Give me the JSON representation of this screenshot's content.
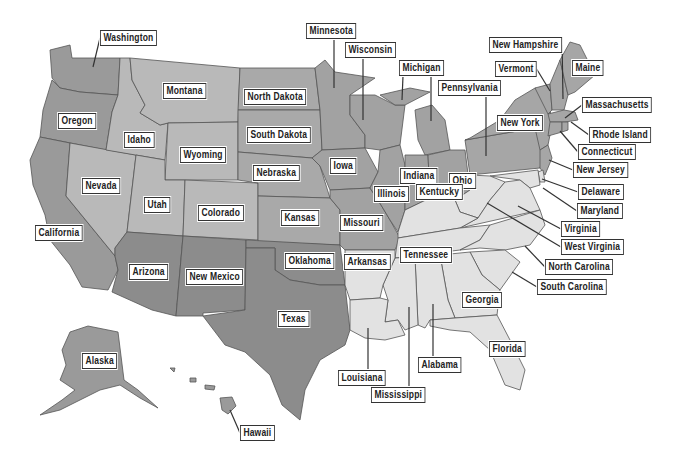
{
  "map": {
    "title": "United States",
    "colors": {
      "west": "#9a9a9a",
      "mountain": "#b9b9b9",
      "plains": "#a9a9a9",
      "southwest": "#8c8c8c",
      "midwest": "#a2a2a2",
      "northeast": "#a6a6a6",
      "south": "#e2e2e2",
      "border": "#555555",
      "label_border": "#333333"
    },
    "labels": [
      {
        "id": "washington",
        "text": "Washington",
        "x": 100,
        "y": 30,
        "lx": 93,
        "ly": 67
      },
      {
        "id": "oregon",
        "text": "Oregon",
        "x": 58,
        "y": 113
      },
      {
        "id": "california",
        "text": "California",
        "x": 35,
        "y": 225
      },
      {
        "id": "nevada",
        "text": "Nevada",
        "x": 82,
        "y": 178
      },
      {
        "id": "idaho",
        "text": "Idaho",
        "x": 124,
        "y": 132
      },
      {
        "id": "montana",
        "text": "Montana",
        "x": 163,
        "y": 83
      },
      {
        "id": "wyoming",
        "text": "Wyoming",
        "x": 180,
        "y": 147
      },
      {
        "id": "utah",
        "text": "Utah",
        "x": 144,
        "y": 197
      },
      {
        "id": "colorado",
        "text": "Colorado",
        "x": 198,
        "y": 205
      },
      {
        "id": "arizona",
        "text": "Arizona",
        "x": 129,
        "y": 264
      },
      {
        "id": "new-mexico",
        "text": "New Mexico",
        "x": 186,
        "y": 269
      },
      {
        "id": "north-dakota",
        "text": "North Dakota",
        "x": 244,
        "y": 89
      },
      {
        "id": "south-dakota",
        "text": "South Dakota",
        "x": 247,
        "y": 127
      },
      {
        "id": "nebraska",
        "text": "Nebraska",
        "x": 253,
        "y": 165
      },
      {
        "id": "kansas",
        "text": "Kansas",
        "x": 281,
        "y": 210
      },
      {
        "id": "oklahoma",
        "text": "Oklahoma",
        "x": 285,
        "y": 253
      },
      {
        "id": "texas",
        "text": "Texas",
        "x": 278,
        "y": 311
      },
      {
        "id": "minnesota",
        "text": "Minnesota",
        "x": 306,
        "y": 23,
        "lx": 334,
        "ly": 88
      },
      {
        "id": "wisconsin",
        "text": "Wisconsin",
        "x": 345,
        "y": 42,
        "lx": 363,
        "ly": 120
      },
      {
        "id": "michigan",
        "text": "Michigan",
        "x": 399,
        "y": 60,
        "lx": 402,
        "ly": 100,
        "lx2": 431,
        "ly2": 121
      },
      {
        "id": "iowa",
        "text": "Iowa",
        "x": 330,
        "y": 158
      },
      {
        "id": "missouri",
        "text": "Missouri",
        "x": 340,
        "y": 215
      },
      {
        "id": "illinois",
        "text": "Illinois",
        "x": 374,
        "y": 186
      },
      {
        "id": "indiana",
        "text": "Indiana",
        "x": 400,
        "y": 168
      },
      {
        "id": "ohio",
        "text": "Ohio",
        "x": 449,
        "y": 173
      },
      {
        "id": "kentucky",
        "text": "Kentucky",
        "x": 416,
        "y": 184
      },
      {
        "id": "arkansas",
        "text": "Arkansas",
        "x": 344,
        "y": 254
      },
      {
        "id": "tennessee",
        "text": "Tennessee",
        "x": 400,
        "y": 247
      },
      {
        "id": "louisiana",
        "text": "Louisiana",
        "x": 338,
        "y": 370,
        "lx": 368,
        "ly": 328
      },
      {
        "id": "mississippi",
        "text": "Mississippi",
        "x": 371,
        "y": 387,
        "lx": 409,
        "ly": 307
      },
      {
        "id": "alabama",
        "text": "Alabama",
        "x": 418,
        "y": 357,
        "lx": 433,
        "ly": 304
      },
      {
        "id": "georgia",
        "text": "Georgia",
        "x": 462,
        "y": 292
      },
      {
        "id": "florida",
        "text": "Florida",
        "x": 489,
        "y": 341
      },
      {
        "id": "pennsylvania",
        "text": "Pennsylvania",
        "x": 438,
        "y": 80,
        "lx": 486,
        "ly": 156
      },
      {
        "id": "new-york",
        "text": "New York",
        "x": 497,
        "y": 115
      },
      {
        "id": "new-hampshire",
        "text": "New Hampshire",
        "x": 489,
        "y": 37,
        "lx": 563,
        "ly": 99
      },
      {
        "id": "vermont",
        "text": "Vermont",
        "x": 495,
        "y": 61,
        "lx": 550,
        "ly": 91
      },
      {
        "id": "maine",
        "text": "Maine",
        "x": 572,
        "y": 60
      },
      {
        "id": "massachusetts",
        "text": "Massachusetts",
        "x": 582,
        "y": 97,
        "lx": 565,
        "ly": 118
      },
      {
        "id": "rhode-island",
        "text": "Rhode Island",
        "x": 589,
        "y": 127,
        "lx": 571,
        "ly": 122
      },
      {
        "id": "connecticut",
        "text": "Connecticut",
        "x": 578,
        "y": 144,
        "lx": 560,
        "ly": 131
      },
      {
        "id": "new-jersey",
        "text": "New Jersey",
        "x": 573,
        "y": 162,
        "lx": 549,
        "ly": 160
      },
      {
        "id": "delaware",
        "text": "Delaware",
        "x": 578,
        "y": 184,
        "lx": 542,
        "ly": 179
      },
      {
        "id": "maryland",
        "text": "Maryland",
        "x": 577,
        "y": 203,
        "lx": 543,
        "ly": 188
      },
      {
        "id": "virginia",
        "text": "Virginia",
        "x": 561,
        "y": 221,
        "lx": 518,
        "ly": 206
      },
      {
        "id": "west-virginia",
        "text": "West Virginia",
        "x": 561,
        "y": 239,
        "lx": 487,
        "ly": 203
      },
      {
        "id": "north-carolina",
        "text": "North Carolina",
        "x": 545,
        "y": 259,
        "lx": 525,
        "ly": 246
      },
      {
        "id": "south-carolina",
        "text": "South Carolina",
        "x": 537,
        "y": 279,
        "lx": 512,
        "ly": 272
      },
      {
        "id": "alaska",
        "text": "Alaska",
        "x": 82,
        "y": 353
      },
      {
        "id": "hawaii",
        "text": "Hawaii",
        "x": 240,
        "y": 425,
        "lx": 230,
        "ly": 410
      }
    ]
  }
}
